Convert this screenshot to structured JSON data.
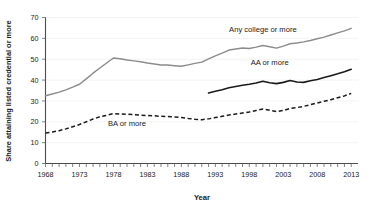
{
  "chart_data": {
    "type": "line",
    "title": "",
    "xlabel": "Year",
    "ylabel": "Share attaining listed credential or more",
    "xlim": [
      1968,
      2014
    ],
    "ylim": [
      0,
      70
    ],
    "yticks": [
      0,
      10,
      20,
      30,
      40,
      50,
      60,
      70
    ],
    "xticks_labeled": [
      1968,
      1973,
      1978,
      1983,
      1988,
      1993,
      1998,
      2003,
      2008,
      2013
    ],
    "xtick_interval": 1,
    "grid": "horizontal-dotted",
    "legend": "inline-annotations",
    "series": [
      {
        "name": "Any college or more",
        "style": "solid",
        "color": "#8c8c8c",
        "label_x": 2000,
        "label_y": 63,
        "x": [
          1968,
          1969,
          1970,
          1971,
          1972,
          1973,
          1974,
          1975,
          1976,
          1977,
          1978,
          1979,
          1980,
          1981,
          1982,
          1983,
          1984,
          1985,
          1986,
          1987,
          1988,
          1989,
          1990,
          1991,
          1992,
          1993,
          1994,
          1995,
          1996,
          1997,
          1998,
          1999,
          2000,
          2001,
          2002,
          2003,
          2004,
          2005,
          2006,
          2007,
          2008,
          2009,
          2010,
          2011,
          2012,
          2013
        ],
        "values": [
          32.5,
          33.3,
          34.2,
          35.3,
          36.6,
          38.0,
          40.6,
          43.3,
          45.8,
          48.2,
          50.6,
          50.2,
          49.6,
          49.2,
          48.8,
          48.2,
          47.7,
          47.2,
          47.2,
          46.9,
          46.6,
          47.3,
          48.0,
          48.6,
          50.2,
          51.6,
          52.9,
          54.4,
          54.9,
          55.4,
          55.1,
          55.8,
          56.6,
          56.0,
          55.3,
          56.3,
          57.4,
          57.8,
          58.3,
          59.0,
          59.8,
          60.6,
          61.6,
          62.6,
          63.6,
          64.8
        ]
      },
      {
        "name": "AA or more",
        "style": "solid",
        "color": "#1a1a1a",
        "label_x": 2001,
        "label_y": 47,
        "x": [
          1992,
          1993,
          1994,
          1995,
          1996,
          1997,
          1998,
          1999,
          2000,
          2001,
          2002,
          2003,
          2004,
          2005,
          2006,
          2007,
          2008,
          2009,
          2010,
          2011,
          2012,
          2013
        ],
        "values": [
          33.8,
          34.6,
          35.4,
          36.3,
          36.9,
          37.5,
          38.0,
          38.6,
          39.4,
          38.7,
          38.3,
          38.9,
          39.8,
          39.1,
          38.9,
          39.7,
          40.3,
          41.2,
          42.1,
          43.0,
          44.0,
          45.2
        ]
      },
      {
        "name": "BA or more",
        "style": "dashed",
        "color": "#1a1a1a",
        "label_x": 1980,
        "label_y": 18,
        "x": [
          1968,
          1969,
          1970,
          1971,
          1972,
          1973,
          1974,
          1975,
          1976,
          1977,
          1978,
          1979,
          1980,
          1981,
          1982,
          1983,
          1984,
          1985,
          1986,
          1987,
          1988,
          1989,
          1990,
          1991,
          1992,
          1993,
          1994,
          1995,
          1996,
          1997,
          1998,
          1999,
          2000,
          2001,
          2002,
          2003,
          2004,
          2005,
          2006,
          2007,
          2008,
          2009,
          2010,
          2011,
          2012,
          2013
        ],
        "values": [
          14.6,
          15.1,
          15.7,
          16.6,
          17.6,
          18.7,
          20.0,
          21.3,
          22.4,
          23.1,
          23.9,
          23.7,
          23.6,
          23.4,
          23.2,
          23.0,
          22.9,
          22.6,
          22.5,
          22.3,
          22.1,
          21.6,
          21.2,
          21.0,
          21.4,
          22.0,
          22.6,
          23.2,
          23.7,
          24.2,
          24.7,
          25.4,
          26.1,
          25.5,
          24.9,
          25.4,
          26.4,
          26.8,
          27.4,
          28.2,
          29.0,
          29.8,
          30.6,
          31.5,
          32.4,
          33.6
        ]
      }
    ]
  }
}
